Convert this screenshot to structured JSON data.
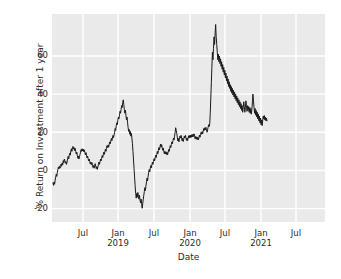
{
  "chart_data": {
    "type": "line",
    "title": "",
    "xlabel": "Date",
    "ylabel": "% Return on Investment after 1 year",
    "grid": true,
    "legend": false,
    "background_color": "#eaeaea",
    "gridline_color": "#ffffff",
    "line_color": "#1a1a1a",
    "ylim": [
      -27,
      82
    ],
    "yticks": [
      -20,
      0,
      20,
      40,
      60
    ],
    "ytick_labels": [
      "-20",
      "0",
      "20",
      "40",
      "60"
    ],
    "xticks": [
      "2018-07",
      "2019-01",
      "2019-07",
      "2020-01",
      "2020-07",
      "2021-01",
      "2021-07"
    ],
    "xtick_labels": [
      {
        "main": "Jul",
        "sub": ""
      },
      {
        "main": "Jan",
        "sub": "2019"
      },
      {
        "main": "Jul",
        "sub": ""
      },
      {
        "main": "Jan",
        "sub": "2020"
      },
      {
        "main": "Jul",
        "sub": ""
      },
      {
        "main": "Jan",
        "sub": "2021"
      },
      {
        "main": "Jul",
        "sub": ""
      }
    ],
    "xlim": [
      "2018-03-20",
      "2021-10-20"
    ],
    "series": [
      {
        "name": "% Return on Investment after 1 year",
        "color": "#1a1a1a",
        "x_start": "2018-04-05",
        "x_end": "2020-12-20",
        "values": [
          -6.5,
          -7.8,
          -6.0,
          -7.2,
          -5.0,
          -3.5,
          -2.0,
          -3.1,
          -1.0,
          0.5,
          1.8,
          0.9,
          2.4,
          1.2,
          2.0,
          3.4,
          2.2,
          4.0,
          3.0,
          5.2,
          4.1,
          6.0,
          5.0,
          3.8,
          4.6,
          3.2,
          4.4,
          6.2,
          7.4,
          6.0,
          7.8,
          9.0,
          8.0,
          10.2,
          11.4,
          10.0,
          11.8,
          12.6,
          11.2,
          12.0,
          10.4,
          11.6,
          10.0,
          8.6,
          9.6,
          8.0,
          6.4,
          7.6,
          6.0,
          7.2,
          8.4,
          9.6,
          11.0,
          10.0,
          11.4,
          10.2,
          11.2,
          9.8,
          10.8,
          9.4,
          8.2,
          9.4,
          8.0,
          6.6,
          7.6,
          6.2,
          5.0,
          6.0,
          4.6,
          3.4,
          4.4,
          3.0,
          4.2,
          2.8,
          1.6,
          2.6,
          1.2,
          2.4,
          3.6,
          2.2,
          1.0,
          2.0,
          0.6,
          1.8,
          3.0,
          4.4,
          3.2,
          4.6,
          6.0,
          5.0,
          6.4,
          7.8,
          6.8,
          8.2,
          9.6,
          8.4,
          9.8,
          11.2,
          10.0,
          11.6,
          13.0,
          12.0,
          13.4,
          12.2,
          13.6,
          15.0,
          14.0,
          15.4,
          16.8,
          15.6,
          17.0,
          18.4,
          17.2,
          18.6,
          20.0,
          22.0,
          21.0,
          23.4,
          25.0,
          24.0,
          26.4,
          28.0,
          27.0,
          29.2,
          31.0,
          30.0,
          32.0,
          34.0,
          33.0,
          35.4,
          37.0,
          34.5,
          32.0,
          30.0,
          31.6,
          29.0,
          26.5,
          28.0,
          25.0,
          22.5,
          20.5,
          21.5,
          19.0,
          20.5,
          18.0,
          19.5,
          17.0,
          14.0,
          10.0,
          5.5,
          1.0,
          -3.5,
          -8.0,
          -12.0,
          -14.5,
          -12.0,
          -14.0,
          -11.5,
          -13.5,
          -15.0,
          -13.0,
          -15.5,
          -17.0,
          -15.0,
          -17.5,
          -19.8,
          -17.5,
          -15.0,
          -13.0,
          -11.0,
          -9.0,
          -10.5,
          -8.0,
          -6.0,
          -4.0,
          -5.5,
          -3.0,
          -1.0,
          0.5,
          -0.8,
          1.2,
          2.6,
          1.4,
          3.0,
          4.4,
          3.2,
          4.8,
          6.2,
          5.0,
          6.6,
          8.0,
          6.8,
          8.4,
          10.0,
          8.8,
          10.4,
          12.0,
          10.8,
          12.4,
          13.8,
          12.2,
          13.6,
          12.0,
          10.6,
          11.8,
          10.2,
          8.8,
          10.0,
          8.6,
          9.8,
          8.4,
          9.6,
          8.2,
          9.4,
          11.0,
          10.0,
          11.6,
          13.0,
          12.0,
          13.6,
          15.0,
          14.0,
          15.6,
          17.0,
          16.0,
          18.0,
          20.0,
          22.4,
          21.0,
          19.5,
          17.5,
          15.5,
          16.8,
          15.0,
          16.4,
          18.0,
          17.0,
          18.4,
          17.0,
          15.5,
          16.8,
          15.2,
          16.6,
          18.0,
          17.0,
          18.4,
          17.2,
          15.8,
          17.0,
          15.6,
          17.0,
          18.2,
          17.0,
          18.4,
          17.2,
          18.6,
          17.4,
          18.8,
          17.6,
          19.0,
          17.8,
          19.2,
          18.0,
          16.6,
          17.8,
          16.4,
          17.6,
          16.2,
          17.4,
          16.0,
          17.2,
          18.6,
          17.4,
          18.8,
          20.0,
          19.0,
          20.4,
          19.2,
          20.6,
          22.0,
          21.0,
          22.4,
          21.2,
          22.6,
          21.4,
          20.0,
          21.2,
          22.6,
          24.0,
          23.0,
          24.4,
          30.0,
          38.0,
          46.0,
          54.0,
          62.0,
          58.0,
          64.0,
          70.0,
          66.0,
          72.0,
          76.5,
          70.0,
          66.0,
          62.0,
          58.0,
          61.0,
          57.0,
          60.0,
          56.0,
          58.5,
          54.5,
          57.0,
          53.0,
          55.5,
          51.5,
          54.0,
          50.0,
          52.5,
          48.5,
          51.0,
          47.0,
          49.5,
          45.5,
          48.0,
          44.0,
          46.5,
          43.0,
          45.0,
          41.5,
          44.0,
          40.5,
          43.0,
          39.5,
          42.0,
          38.5,
          41.0,
          37.5,
          40.0,
          36.5,
          39.0,
          35.5,
          38.0,
          34.5,
          37.0,
          33.5,
          36.0,
          32.5,
          35.0,
          31.5,
          34.0,
          30.5,
          33.0,
          36.0,
          33.5,
          30.5,
          33.0,
          36.5,
          34.0,
          31.0,
          34.0,
          31.5,
          33.5,
          30.5,
          33.0,
          30.0,
          32.5,
          29.5,
          32.0,
          36.0,
          40.0,
          36.5,
          33.0,
          30.0,
          32.5,
          29.0,
          31.5,
          28.0,
          30.5,
          27.0,
          29.5,
          26.0,
          28.5,
          25.0,
          27.5,
          24.0,
          26.5,
          23.5,
          26.0,
          28.5,
          27.0,
          28.8,
          26.5,
          28.0,
          26.0,
          27.5,
          26.0
        ]
      }
    ]
  }
}
